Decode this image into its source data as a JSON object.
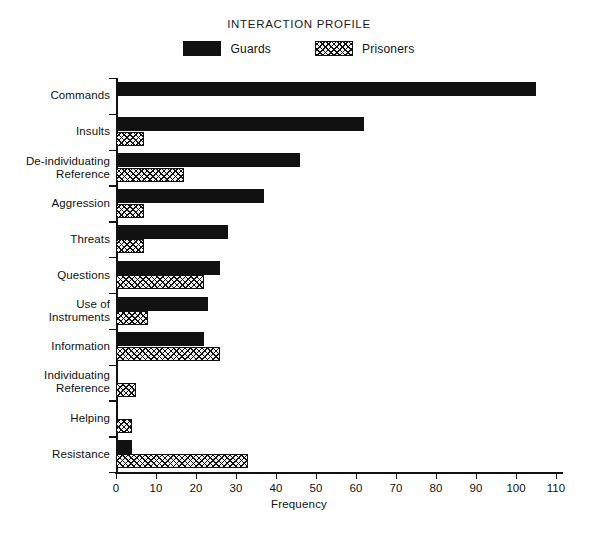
{
  "chart_data": {
    "type": "bar",
    "orientation": "horizontal",
    "title": "INTERACTION PROFILE",
    "xlabel": "Frequency",
    "ylabel": "",
    "xlim": [
      0,
      115
    ],
    "xticks": [
      0,
      10,
      20,
      30,
      40,
      50,
      60,
      70,
      80,
      90,
      100,
      110
    ],
    "grid": false,
    "legend_position": "top-center",
    "categories": [
      "Commands",
      "Insults",
      "De-individuating Reference",
      "Aggression",
      "Threats",
      "Questions",
      "Use of Instruments",
      "Information",
      "Individuating Reference",
      "Helping",
      "Resistance"
    ],
    "category_lines": [
      [
        "Commands"
      ],
      [
        "Insults"
      ],
      [
        "De-individuating",
        "Reference"
      ],
      [
        "Aggression"
      ],
      [
        "Threats"
      ],
      [
        "Questions"
      ],
      [
        "Use of",
        "Instruments"
      ],
      [
        "Information"
      ],
      [
        "Individuating",
        "Reference"
      ],
      [
        "Helping"
      ],
      [
        "Resistance"
      ]
    ],
    "series": [
      {
        "name": "Guards",
        "fill": "solid-black",
        "color": "#111111",
        "values": [
          105,
          62,
          46,
          37,
          28,
          26,
          23,
          22,
          0,
          0,
          4
        ]
      },
      {
        "name": "Prisoners",
        "fill": "cross-hatch",
        "color": "#111111",
        "values": [
          0,
          7,
          17,
          7,
          7,
          22,
          8,
          26,
          5,
          4,
          33
        ]
      }
    ]
  }
}
